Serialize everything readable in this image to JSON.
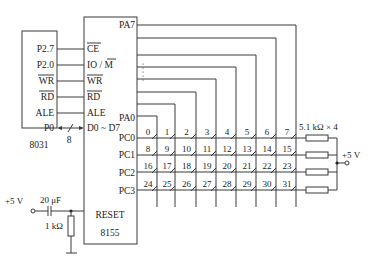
{
  "diagram": {
    "mcu": {
      "name": "8031",
      "pins": [
        "P2.7",
        "P2.0",
        "WR",
        "RD",
        "ALE",
        "P0"
      ],
      "overlined": [
        "WR",
        "RD"
      ]
    },
    "io_chip": {
      "name": "8155",
      "left_pins": [
        "CE",
        "IO / M",
        "WR",
        "RD",
        "ALE",
        "D0 ~ D7"
      ],
      "reset_label": "RESET",
      "port_a_top": "PA7",
      "port_a_bottom": "PA0",
      "ellipsis": "⋮",
      "port_c_rows": [
        "PC0",
        "PC1",
        "PC2",
        "PC3"
      ]
    },
    "bus": {
      "width_label": "8"
    },
    "reset_circuit": {
      "supply": "+5 V",
      "capacitor": "20 μF",
      "resistor": "1 kΩ"
    },
    "pullups": {
      "label": "5.1 kΩ × 4",
      "supply": "+5 V"
    },
    "keys": [
      [
        "0",
        "1",
        "2",
        "3",
        "4",
        "5",
        "6",
        "7"
      ],
      [
        "8",
        "9",
        "10",
        "11",
        "12",
        "13",
        "14",
        "15"
      ],
      [
        "16",
        "17",
        "18",
        "19",
        "20",
        "21",
        "22",
        "23"
      ],
      [
        "24",
        "25",
        "26",
        "27",
        "28",
        "29",
        "30",
        "31"
      ]
    ]
  }
}
